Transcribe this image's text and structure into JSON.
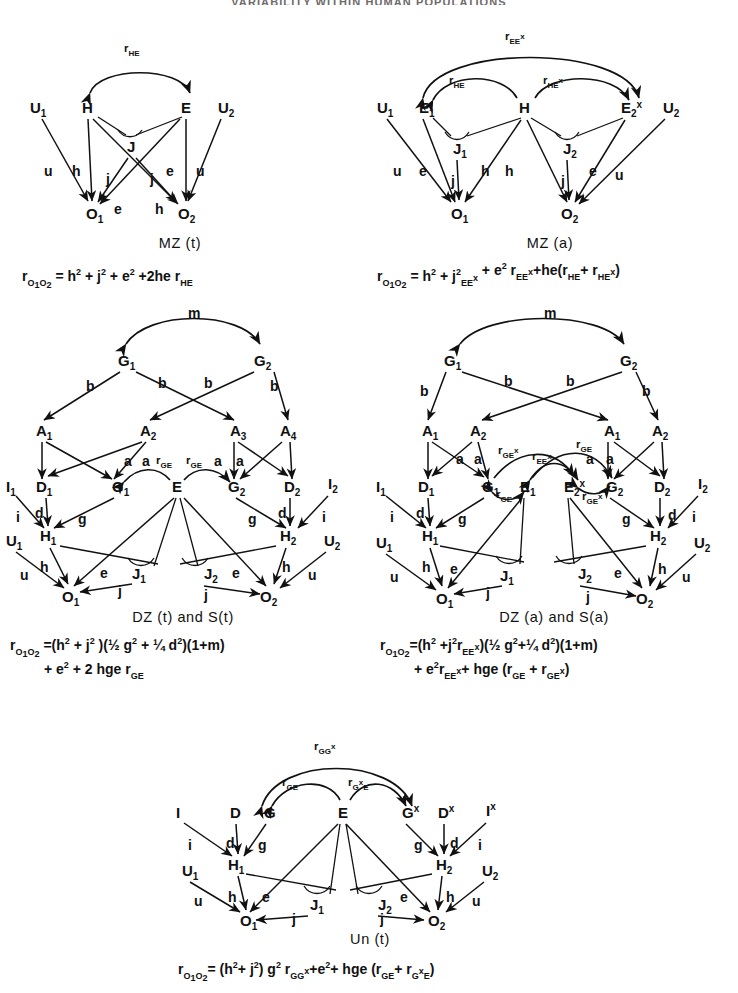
{
  "header": {
    "running_title": "VARIABILITY WITHIN HUMAN POPULATIONS"
  },
  "panels": [
    {
      "id": "mz-t",
      "caption": "MZ (t)",
      "nodes": [
        "U₁",
        "H",
        "E",
        "U₂",
        "J",
        "O₁",
        "O₂"
      ],
      "correlations": [
        "r_HE"
      ],
      "path_coefficients": [
        "u",
        "h",
        "j",
        "j",
        "e",
        "u",
        "e",
        "h"
      ],
      "equation_lines": [
        "r_O₁O₂ = h² + j² + e² + 2he r_HE"
      ]
    },
    {
      "id": "mz-a",
      "caption": "MZ (a)",
      "nodes": [
        "U₁",
        "E₁",
        "H",
        "E₂ˣ",
        "U₂",
        "J₁",
        "J₂",
        "O₁",
        "O₂"
      ],
      "correlations": [
        "r_EEˣ",
        "r_HE",
        "r_HEˣ"
      ],
      "path_coefficients": [
        "u",
        "e",
        "j",
        "h",
        "h",
        "j",
        "e",
        "u"
      ],
      "equation_lines": [
        "r_O₁O₂ = h² + j²r_EEˣ + e² r_EEˣ + he(r_HE + r_HEˣ)"
      ]
    },
    {
      "id": "dz-t",
      "caption": "DZ (t) and S(t)",
      "nodes": [
        "G₁",
        "G₂",
        "A₁",
        "A₂",
        "A₃",
        "A₄",
        "I₁",
        "D₁",
        "G₁",
        "E",
        "G₂",
        "D₂",
        "I₂",
        "U₁",
        "H₁",
        "H₂",
        "U₂",
        "J₁",
        "J₂",
        "O₁",
        "O₂"
      ],
      "correlations": [
        "m",
        "r_GE",
        "r_GE"
      ],
      "path_coefficients": [
        "b",
        "b",
        "b",
        "b",
        "a",
        "a",
        "a",
        "a",
        "i",
        "d",
        "g",
        "g",
        "d",
        "i",
        "u",
        "h",
        "e",
        "j",
        "j",
        "e",
        "h",
        "u"
      ],
      "equation_lines": [
        "r_O₁O₂ = (h² + j²)(½ g² + ¼ d²)(1+m)",
        "+ e² + 2 hge r_GE"
      ]
    },
    {
      "id": "dz-a",
      "caption": "DZ (a) and S(a)",
      "nodes": [
        "G₁",
        "G₂",
        "A₁",
        "A₂",
        "A₁",
        "A₂",
        "I₁",
        "D₁",
        "G₁",
        "E₁",
        "E₂ˣ",
        "G₂",
        "D₂",
        "I₂",
        "U₁",
        "H₁",
        "H₂",
        "U₂",
        "J₁",
        "J₂",
        "O₁",
        "O₂"
      ],
      "correlations": [
        "m",
        "r_GEˣ",
        "r_EEˣ",
        "r_GE",
        "r_GE",
        "r_GEˣ"
      ],
      "path_coefficients": [
        "b",
        "b",
        "b",
        "b",
        "a",
        "a",
        "a",
        "a",
        "i",
        "d",
        "g",
        "g",
        "d",
        "i",
        "u",
        "h",
        "e",
        "j",
        "j",
        "e",
        "h",
        "u"
      ],
      "equation_lines": [
        "r_O₁O₂ = (h² + j²r_EEˣ)(½ g² + ¼ d²)(1+m)",
        "+ e²r_EEˣ + hge (r_GE + r_GEˣ)"
      ]
    },
    {
      "id": "un-t",
      "caption": "Un (t)",
      "nodes": [
        "I",
        "D",
        "G",
        "E",
        "Gˣ",
        "Dˣ",
        "Iˣ",
        "U₁",
        "H₁",
        "H₂",
        "U₂",
        "J₁",
        "J₂",
        "O₁",
        "O₂"
      ],
      "correlations": [
        "r_GGˣ",
        "r_GE",
        "r_GˣE"
      ],
      "path_coefficients": [
        "i",
        "d",
        "g",
        "g",
        "d",
        "i",
        "u",
        "h",
        "e",
        "j",
        "j",
        "e",
        "h",
        "u"
      ],
      "equation_lines": [
        "r_O₁O₂ = (h² + j²) g² r_GGˣ + e² + hge (r_GE + r_GˣE)"
      ]
    }
  ],
  "labels": {
    "U1": "U",
    "U2": "U",
    "H": "H",
    "E": "E",
    "J": "J",
    "O1": "O",
    "O2": "O",
    "G": "G",
    "A": "A",
    "D": "D",
    "I": "I",
    "sub1": "₁",
    "sub2": "₂",
    "sub3": "₃",
    "sub4": "₄",
    "supx": "x",
    "r": "r",
    "m": "m",
    "and": "and",
    "b": "b",
    "a": "a",
    "d": "d",
    "i": "i",
    "g": "g",
    "u": "u",
    "h": "h",
    "e": "e",
    "j": "j"
  },
  "colors": {
    "ink": "#111111",
    "paper": "#ffffff",
    "header": "#6e6a6a"
  }
}
